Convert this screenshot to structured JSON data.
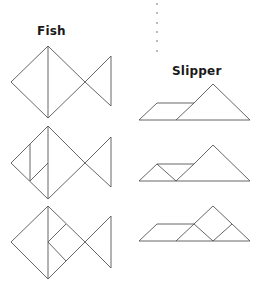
{
  "fish": {
    "title": "Fish",
    "figures": [
      {
        "outline": "11,82 48,46 85,82 111,56 111,106 85,82 48,118",
        "inner_lines": [
          "48,46 48,118"
        ]
      },
      {
        "outline": "11,163 48,126 85,163 111,137 111,187 85,163 48,199",
        "inner_lines": [
          "48,126 48,199",
          "30,144 30,181",
          "30,181 48,163"
        ]
      },
      {
        "outline": "11,242 48,206 85,242 111,216 111,268 85,242 48,279",
        "inner_lines": [
          "48,206 48,279",
          "48,242 66,224",
          "48,242 66,261"
        ]
      }
    ]
  },
  "slipper": {
    "title": "Slipper",
    "figures": [
      {
        "outline": "139,120 157,103 194,103 213,84 250,120",
        "inner_lines": [
          "176,120 194,103"
        ]
      },
      {
        "outline": "139,181 157,164 194,164 213,145 250,181",
        "inner_lines": [
          "176,181 194,164",
          "157,164 176,181"
        ]
      },
      {
        "outline": "139,241 157,224 194,224 213,206 250,241",
        "inner_lines": [
          "176,241 194,224",
          "194,224 213,241",
          "213,241 232,224"
        ]
      }
    ]
  },
  "divider": {
    "x": 157,
    "dots_y": [
      4,
      13,
      23,
      32,
      41,
      51
    ]
  },
  "colors": {
    "stroke": "#555555",
    "text": "#1a1a1a",
    "background": "#ffffff"
  }
}
